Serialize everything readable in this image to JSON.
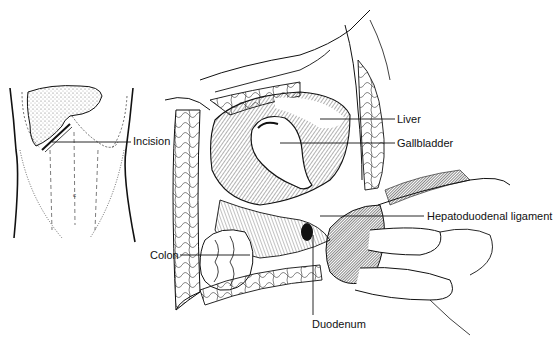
{
  "figure": {
    "type": "surgical anatomical illustration",
    "panels": [
      {
        "name": "abdomen-overview",
        "description": "torso outline with stippled liver and subcostal incision line"
      },
      {
        "name": "operative-field",
        "description": "retracted abdominal wall exposing liver, gallbladder, colon, duodenum"
      }
    ]
  },
  "labels": {
    "incision": "Incision",
    "liver": "Liver",
    "gallbladder": "Gallbladder",
    "hepatoduodenal_ligament": "Hepatoduodenal ligament",
    "colon": "Colon",
    "duodenum": "Duodenum"
  },
  "colors": {
    "ink": "#111111",
    "background": "#ffffff",
    "stipple": "#555555"
  }
}
